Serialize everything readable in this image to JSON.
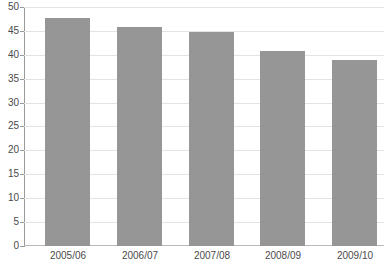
{
  "chart_data": {
    "type": "bar",
    "title": "",
    "subtitle": "",
    "xlabel": "",
    "ylabel": "",
    "categories": [
      "2005/06",
      "2006/07",
      "2007/08",
      "2008/09",
      "2009/10"
    ],
    "values": [
      48,
      46,
      45,
      41,
      39
    ],
    "series": [
      {
        "name": "",
        "values": [
          48,
          46,
          45,
          41,
          39
        ]
      }
    ],
    "ylim": [
      0,
      50
    ],
    "y_ticks": [
      50,
      45,
      40,
      35,
      30,
      25,
      20,
      15,
      10,
      5,
      0
    ],
    "y_tick_labels": [
      "50",
      "45",
      "40",
      "35",
      "30",
      "25",
      "20",
      "15",
      "10",
      "5",
      "0"
    ],
    "grid": true,
    "grid_axis": "y",
    "legend": false,
    "legend_position": "none",
    "annotations": [],
    "colors": {
      "bar_fill": "#969696",
      "gridline": "#e3e3e3",
      "axis_line": "#9a9a9a",
      "baseline": "#b9b9b9",
      "tick_label": "#4a4a4a",
      "background": "#ffffff"
    }
  }
}
